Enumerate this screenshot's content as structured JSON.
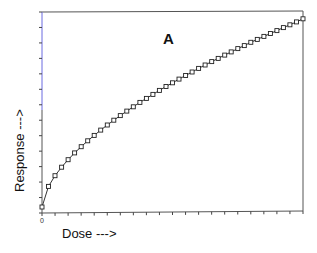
{
  "chart_data": {
    "type": "line",
    "title": "",
    "panel_label": "A",
    "xlabel": "Dose --->",
    "ylabel": "Response --->",
    "x_tick_labels": [
      "0"
    ],
    "x_ticks_count": 21,
    "y_ticks_count": 14,
    "xlim": [
      0,
      20
    ],
    "ylim": [
      0,
      13
    ],
    "grid": false,
    "legend": null,
    "marker": "open-square",
    "line_color": "#333333",
    "axis_colors": {
      "left": "#6b6be0",
      "other": "#555555"
    },
    "series": [
      {
        "name": "Response",
        "x": [
          0,
          0.5,
          1,
          1.5,
          2,
          2.5,
          3,
          3.5,
          4,
          4.5,
          5,
          5.5,
          6,
          6.5,
          7,
          7.5,
          8,
          8.5,
          9,
          9.5,
          10,
          10.5,
          11,
          11.5,
          12,
          12.5,
          13,
          13.5,
          14,
          14.5,
          15,
          15.5,
          16,
          16.5,
          17,
          17.5,
          18,
          18.5,
          19,
          19.5,
          20
        ],
        "values": [
          0.39,
          1.72,
          2.41,
          2.96,
          3.45,
          3.89,
          4.29,
          4.67,
          5.02,
          5.36,
          5.69,
          6.0,
          6.3,
          6.59,
          6.87,
          7.15,
          7.41,
          7.67,
          7.93,
          8.18,
          8.42,
          8.66,
          8.89,
          9.12,
          9.35,
          9.57,
          9.79,
          10.0,
          10.21,
          10.42,
          10.63,
          10.83,
          11.04,
          11.23,
          11.42,
          11.61,
          11.8,
          11.99,
          12.17,
          12.36,
          12.56
        ]
      }
    ]
  }
}
